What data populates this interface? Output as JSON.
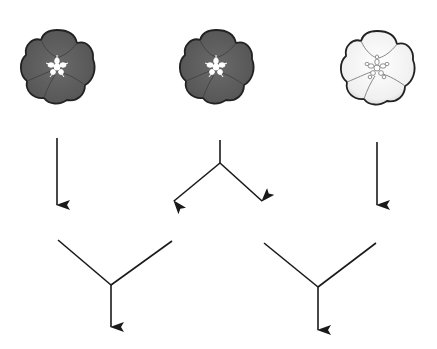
{
  "diagram": {
    "colors": {
      "dark_petal": "#5f5f5f",
      "dark_petal_shade": "#4a4a4a",
      "light_petal": "#f4f4f4",
      "light_petal_shade": "#c8c8c8",
      "outline": "#222222",
      "arrow": "#1a1a1a",
      "background": "#ffffff"
    },
    "flowers": [
      {
        "id": "flower-left",
        "color": "dark",
        "cx": 57,
        "cy": 67
      },
      {
        "id": "flower-middle",
        "color": "dark",
        "cx": 216,
        "cy": 67
      },
      {
        "id": "flower-right",
        "color": "white",
        "cx": 377,
        "cy": 68
      }
    ],
    "connectors": [
      {
        "id": "arrow-left-down",
        "type": "arrow"
      },
      {
        "id": "fork-middle",
        "type": "fork"
      },
      {
        "id": "arrow-right-down",
        "type": "arrow"
      },
      {
        "id": "merge-left",
        "type": "merge"
      },
      {
        "id": "merge-right",
        "type": "merge"
      }
    ]
  }
}
